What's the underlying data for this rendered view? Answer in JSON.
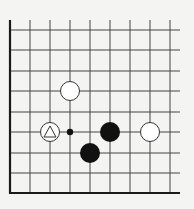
{
  "diagram": {
    "type": "go-board-fragment",
    "colors": {
      "background": "#f4f4f2",
      "line": "#444444",
      "edge": "#1a1a1a",
      "black_stone": "#111111",
      "white_stone_fill": "#ffffff",
      "white_stone_stroke": "#333333"
    },
    "grid": {
      "columns": 9,
      "rows": 9,
      "x": [
        10,
        30,
        50,
        70,
        90,
        110,
        130,
        150,
        170
      ],
      "y": [
        30,
        50,
        71,
        91,
        112,
        132,
        153,
        173,
        193
      ],
      "top_open_to": 20,
      "right_open_to": 180,
      "left_edge": true,
      "bottom_edge": true
    },
    "stones": [
      {
        "color": "white",
        "col": 3,
        "row": 3,
        "marker": null
      },
      {
        "color": "white",
        "col": 2,
        "row": 5,
        "marker": "triangle"
      },
      {
        "color": "black",
        "col": 5,
        "row": 5,
        "marker": null
      },
      {
        "color": "white",
        "col": 7,
        "row": 5,
        "marker": null
      },
      {
        "color": "black",
        "col": 4,
        "row": 6,
        "marker": null
      }
    ],
    "points": [
      {
        "type": "small-dot",
        "col": 3,
        "row": 5
      }
    ]
  }
}
